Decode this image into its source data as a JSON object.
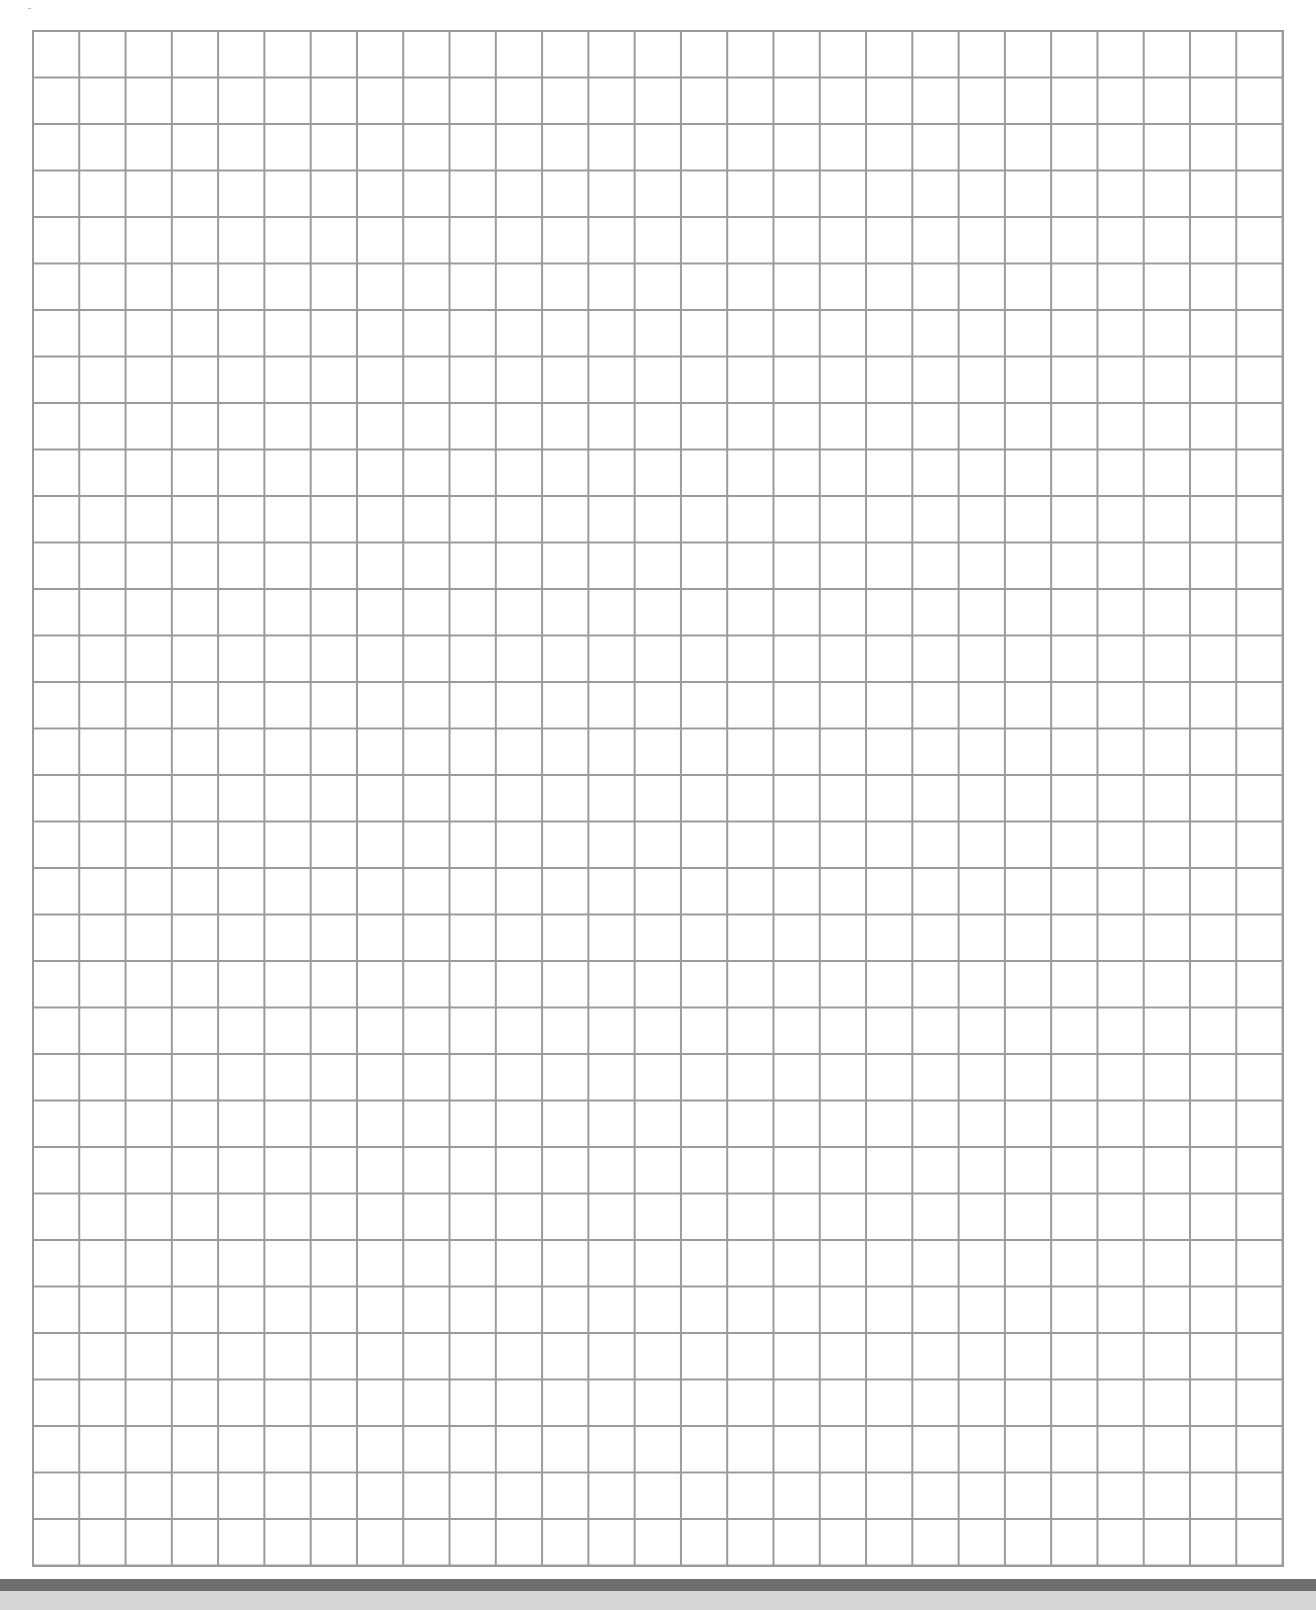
{
  "page": {
    "type": "grid-paper",
    "grid": {
      "columns": 27,
      "rows": 33,
      "line_color": "#9a9a9a",
      "background_color": "#ffffff"
    },
    "bottom_band": {
      "dark_color": "#6e6e6e",
      "light_color": "#d6d6d6"
    }
  }
}
